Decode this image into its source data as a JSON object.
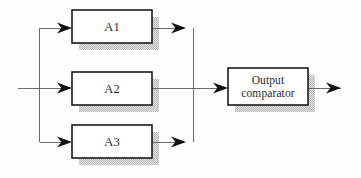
{
  "diagram": {
    "type": "block-diagram",
    "background_color": "#fefefe",
    "line_color": "#555555",
    "box_border_color": "#1a1a1a",
    "box_fill_color": "#ffffff",
    "shadow_color": "#c9c9c9",
    "text_color": "#2a2a2a",
    "arrow_color": "#111111",
    "blocks": [
      {
        "id": "a1",
        "label": "A1",
        "x": 72,
        "y": 10,
        "width": 80,
        "height": 33,
        "shadow_offset": 7
      },
      {
        "id": "a2",
        "label": "A2",
        "x": 72,
        "y": 72,
        "width": 80,
        "height": 33,
        "shadow_offset": 7
      },
      {
        "id": "a3",
        "label": "A3",
        "x": 72,
        "y": 125,
        "width": 80,
        "height": 33,
        "shadow_offset": 7
      },
      {
        "id": "comparator",
        "label": "Output\ncomparator",
        "x": 228,
        "y": 68,
        "width": 80,
        "height": 37,
        "shadow_offset": 7
      }
    ],
    "nodes": {
      "input_line_start_x": 18,
      "input_branch_x": 39,
      "merge_branch_x": 193,
      "mid_y": 88,
      "top_y": 28,
      "bottom_y": 142,
      "output_line_end_x": 341
    },
    "connectors": [
      {
        "id": "input-trunk",
        "from": "input-source",
        "to": "input-branch"
      },
      {
        "id": "branch-to-a1",
        "from": "input-branch",
        "to": "a1"
      },
      {
        "id": "branch-to-a2",
        "from": "input-branch",
        "to": "a2"
      },
      {
        "id": "branch-to-a3",
        "from": "input-branch",
        "to": "a3"
      },
      {
        "id": "a1-to-merge",
        "from": "a1",
        "to": "merge-branch"
      },
      {
        "id": "a2-to-comparator",
        "from": "a2",
        "to": "comparator"
      },
      {
        "id": "a3-to-merge",
        "from": "a3",
        "to": "merge-branch"
      },
      {
        "id": "comparator-to-output",
        "from": "comparator",
        "to": "output-sink"
      }
    ],
    "arrowheads": [
      {
        "id": "arrow-into-a1",
        "x": 67,
        "y": 28,
        "direction": "right"
      },
      {
        "id": "arrow-into-a2",
        "x": 67,
        "y": 88,
        "direction": "right"
      },
      {
        "id": "arrow-into-a3",
        "x": 67,
        "y": 142,
        "direction": "right"
      },
      {
        "id": "arrow-a1-out",
        "x": 184,
        "y": 28,
        "direction": "right"
      },
      {
        "id": "arrow-a3-out",
        "x": 184,
        "y": 142,
        "direction": "right"
      },
      {
        "id": "arrow-into-comparator",
        "x": 224,
        "y": 88,
        "direction": "right"
      },
      {
        "id": "arrow-output",
        "x": 340,
        "y": 88,
        "direction": "right"
      }
    ]
  }
}
